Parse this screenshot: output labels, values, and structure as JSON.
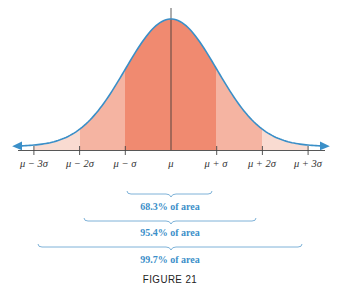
{
  "chart_data": {
    "type": "area",
    "title": "",
    "caption": "FIGURE 21",
    "xlabel": "",
    "ylabel": "",
    "grid": false,
    "x_ticks": [
      "μ − 3σ",
      "μ − 2σ",
      "μ − σ",
      "μ",
      "μ + σ",
      "μ + 2σ",
      "μ + 3σ"
    ],
    "x_tick_values": [
      -3,
      -2,
      -1,
      0,
      1,
      2,
      3
    ],
    "regions": [
      {
        "from": -1,
        "to": 1,
        "shade": "dark",
        "percent_area": 68.3,
        "label": "68.3% of area"
      },
      {
        "from": -2,
        "to": 2,
        "shade": "medium",
        "percent_area": 95.4,
        "label": "95.4% of area"
      },
      {
        "from": -3,
        "to": 3,
        "shade": "light",
        "percent_area": 99.7,
        "label": "99.7% of area"
      }
    ],
    "curve": {
      "type": "normal",
      "mean": 0,
      "sd": 1,
      "arrows_both_ends": true
    },
    "colors": {
      "curve": "#3a8fc8",
      "dark_fill": "#f08a70",
      "medium_fill": "#f5b4a2",
      "light_fill": "#f9dbd1",
      "label_text": "#3b8fc9",
      "axis": "#444444"
    }
  },
  "labels": {
    "ticks": [
      "μ − 3σ",
      "μ − 2σ",
      "μ − σ",
      "μ",
      "μ + σ",
      "μ + 2σ",
      "μ + 3σ"
    ],
    "area_68": "68.3% of area",
    "area_95": "95.4% of area",
    "area_99": "99.7% of area",
    "caption": "FIGURE 21"
  }
}
